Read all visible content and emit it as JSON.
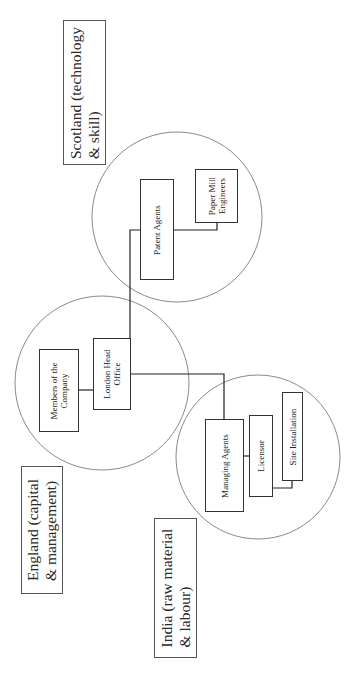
{
  "diagram": {
    "type": "organizational-network",
    "orientation": "rotated-90-ccw",
    "colors": {
      "line": "#222222",
      "circle": "#888888",
      "box_border": "#333333",
      "background": "#ffffff"
    },
    "regions": [
      {
        "id": "scotland",
        "label_line1": "Scotland (technology",
        "label_line2": "& skill)"
      },
      {
        "id": "england",
        "label_line1": "England (capital",
        "label_line2": "& management)"
      },
      {
        "id": "india",
        "label_line1": "India (raw material",
        "label_line2": "& labour)"
      }
    ],
    "nodes": {
      "patent_agents": {
        "region": "scotland",
        "label": "Patent Agents"
      },
      "paper_mill_engineers": {
        "region": "scotland",
        "line1": "Paper Mill",
        "line2": "Engineers"
      },
      "members_of_company": {
        "region": "england",
        "line1": "Members of the",
        "line2": "Company"
      },
      "london_head_office": {
        "region": "england",
        "line1": "London Head",
        "line2": "Office"
      },
      "managing_agents": {
        "region": "india",
        "label": "Managing Agents"
      },
      "licensor": {
        "region": "india",
        "label": "Licensor"
      },
      "site_installation": {
        "region": "india",
        "label": "Site Installation"
      }
    },
    "connections": [
      [
        "london_head_office",
        "patent_agents"
      ],
      [
        "london_head_office",
        "managing_agents"
      ],
      [
        "london_head_office",
        "members_of_company"
      ],
      [
        "patent_agents",
        "paper_mill_engineers"
      ],
      [
        "managing_agents",
        "licensor"
      ],
      [
        "licensor",
        "site_installation"
      ]
    ]
  }
}
